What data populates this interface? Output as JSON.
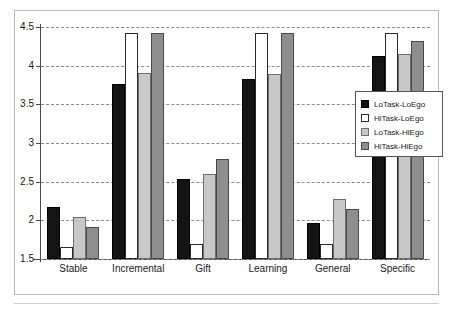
{
  "chart_data": {
    "type": "bar",
    "title": "",
    "subtitle": "",
    "xlabel": "",
    "ylabel": "",
    "ylim": [
      1.5,
      4.5
    ],
    "ytick_labels": [
      "4.5",
      "4",
      "3.5",
      "3",
      "2.5",
      "2",
      "1.5"
    ],
    "yticks": [
      4.5,
      4,
      3.5,
      3,
      2.5,
      2,
      1.5
    ],
    "grid": true,
    "legend_position": "right",
    "categories": [
      "Stable",
      "Incremental",
      "Gift",
      "Learning",
      "General",
      "Specific"
    ],
    "series": [
      {
        "name": "LoTask-LoEgo",
        "color": "#141414",
        "values": [
          2.17,
          3.76,
          2.54,
          3.83,
          1.96,
          4.13
        ]
      },
      {
        "name": "HiTask-LoEgo",
        "color": "#ffffff",
        "values": [
          1.66,
          4.42,
          1.69,
          4.42,
          1.69,
          4.42
        ]
      },
      {
        "name": "LoTask-HiEgo",
        "color": "#c8c8c8",
        "values": [
          2.04,
          3.91,
          2.6,
          3.89,
          2.27,
          4.15
        ]
      },
      {
        "name": "HiTask-HiEgo",
        "color": "#8e8e8e",
        "values": [
          1.92,
          4.42,
          2.79,
          4.42,
          2.15,
          4.32
        ]
      }
    ]
  }
}
